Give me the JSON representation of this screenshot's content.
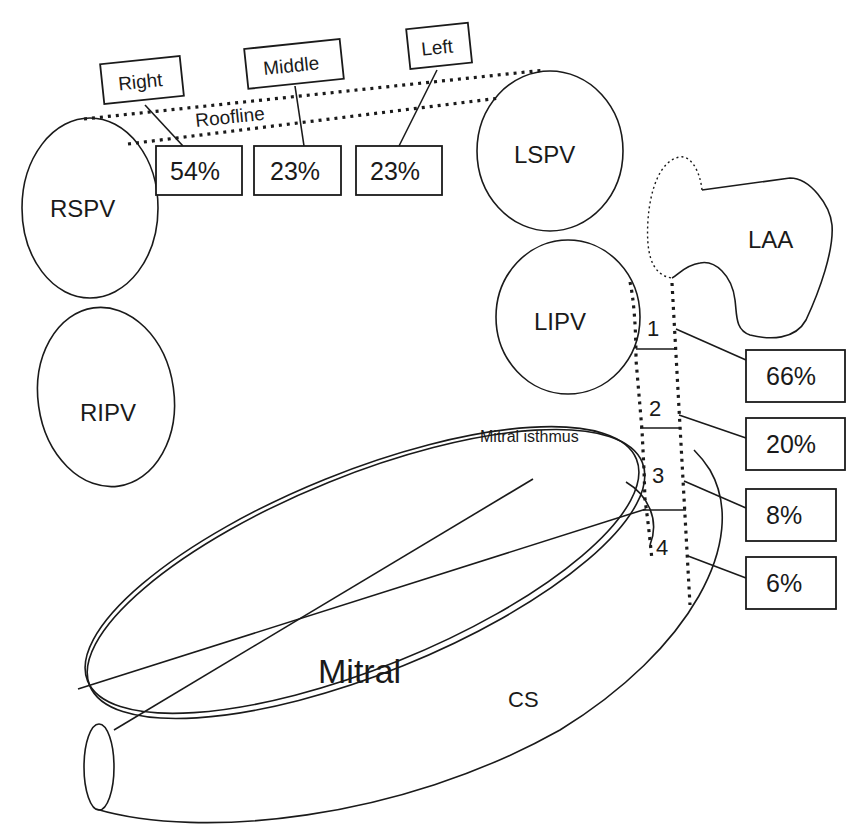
{
  "diagram": {
    "veins": {
      "rspv": "RSPV",
      "ripv": "RIPV",
      "lspv": "LSPV",
      "lipv": "LIPV",
      "laa": "LAA"
    },
    "roofline": {
      "label": "Roofline",
      "segments": [
        {
          "name": "Right",
          "value": "54%"
        },
        {
          "name": "Middle",
          "value": "23%"
        },
        {
          "name": "Left",
          "value": "23%"
        }
      ]
    },
    "mitral_isthmus": {
      "label": "Mitral isthmus",
      "segments": [
        {
          "number": "1",
          "value": "66%"
        },
        {
          "number": "2",
          "value": "20%"
        },
        {
          "number": "3",
          "value": "8%"
        },
        {
          "number": "4",
          "value": "6%"
        }
      ]
    },
    "mitral": "Mitral",
    "cs": "CS"
  }
}
